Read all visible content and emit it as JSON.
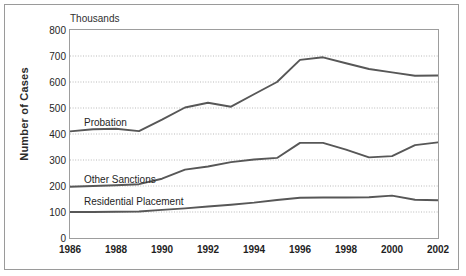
{
  "figure": {
    "units_label": "Thousands",
    "y_axis_title": "Number of Cases"
  },
  "chart_data": {
    "type": "line",
    "title": "",
    "subtitle": "",
    "units_note": "Thousands",
    "xlabel": "",
    "ylabel": "Number of Cases",
    "xlim": [
      1986,
      2002
    ],
    "ylim": [
      0,
      800
    ],
    "ytick_interval": 100,
    "xtick_interval": 2,
    "grid": true,
    "grid_style": "dotted-horizontal",
    "legend_position": "inline-labels",
    "x": [
      1986,
      1987,
      1988,
      1989,
      1990,
      1991,
      1992,
      1993,
      1994,
      1995,
      1996,
      1997,
      1998,
      1999,
      2000,
      2001,
      2002
    ],
    "xtick_labels": [
      "1986",
      "1988",
      "1990",
      "1992",
      "1994",
      "1996",
      "1998",
      "2000",
      "2002"
    ],
    "ytick_labels": [
      "0",
      "100",
      "200",
      "300",
      "400",
      "500",
      "600",
      "700",
      "800"
    ],
    "series": [
      {
        "name": "Probation",
        "color": "#575757",
        "values": [
          410,
          418,
          420,
          411,
          455,
          502,
          520,
          505,
          553,
          600,
          685,
          695,
          672,
          650,
          637,
          624,
          625
        ]
      },
      {
        "name": "Other Sanctions",
        "color": "#575757",
        "values": [
          197,
          200,
          203,
          207,
          228,
          263,
          275,
          292,
          302,
          308,
          366,
          366,
          340,
          310,
          315,
          357,
          368
        ]
      },
      {
        "name": "Residential Placement",
        "color": "#575757",
        "values": [
          100,
          100,
          101,
          102,
          108,
          114,
          121,
          128,
          136,
          146,
          155,
          156,
          156,
          157,
          163,
          147,
          145
        ]
      }
    ]
  }
}
